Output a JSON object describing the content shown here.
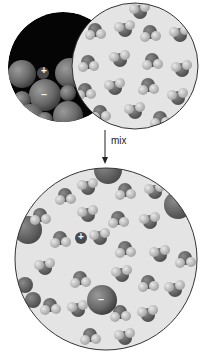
{
  "diagram": {
    "arrow_label": "mix",
    "ion_plus": "+",
    "ion_minus": "–",
    "colors": {
      "background": "#ffffff",
      "solid_bg": "#050505",
      "liquid_bg": "#e4e4e4",
      "ion_dark": "#5a5a5a",
      "ion_light": "#8c8c8c",
      "molecule_dark": "#6e6e6e",
      "molecule_light": "#c4c4c4",
      "outline": "#333333"
    },
    "panels": [
      {
        "name": "ionic-solid",
        "cx": 63,
        "cy": 67,
        "r": 55
      },
      {
        "name": "solvent",
        "cx": 135,
        "cy": 66,
        "r": 63
      },
      {
        "name": "solution",
        "cx": 106,
        "cy": 259,
        "r": 91
      }
    ]
  }
}
